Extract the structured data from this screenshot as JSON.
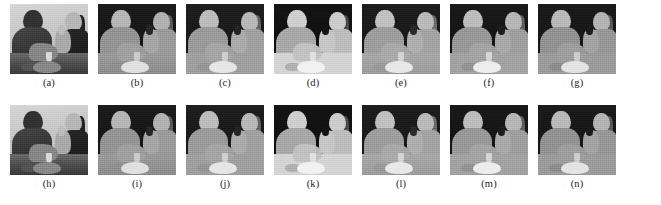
{
  "figure": {
    "background_color": "#ffffff",
    "rows": 2,
    "columns": 7,
    "tile_width_px": 78,
    "tile_height_px": 70
  },
  "panels": [
    {
      "label": "(a)",
      "kind": "photo",
      "style_key": "photo",
      "name": "panel-a",
      "description": "Grayscale photograph of two people seated at a table facing each other"
    },
    {
      "label": "(b)",
      "kind": "depth-map",
      "style_key": "d-b",
      "name": "panel-b",
      "description": "Estimated depth map, dark background with mid-gray figures"
    },
    {
      "label": "(c)",
      "kind": "depth-map",
      "style_key": "d-c",
      "name": "panel-c",
      "description": "Estimated depth map, slightly brighter figures than (b)"
    },
    {
      "label": "(d)",
      "kind": "depth-map",
      "style_key": "d-d",
      "name": "panel-d",
      "description": "Estimated depth map, high contrast with very bright foreground"
    },
    {
      "label": "(e)",
      "kind": "depth-map",
      "style_key": "d-e",
      "name": "panel-e",
      "description": "Estimated depth map, smooth gradients across the table"
    },
    {
      "label": "(f)",
      "kind": "depth-map",
      "style_key": "d-f",
      "name": "panel-f",
      "description": "Estimated depth map, well-defined raised hand and arm"
    },
    {
      "label": "(g)",
      "kind": "depth-map",
      "style_key": "d-g",
      "name": "panel-g",
      "description": "Estimated depth map, flatter separation near the table"
    },
    {
      "label": "(h)",
      "kind": "photo",
      "style_key": "photo",
      "name": "panel-h",
      "description": "Grayscale photograph, second frame of the same scene"
    },
    {
      "label": "(i)",
      "kind": "depth-map",
      "style_key": "d-b",
      "name": "panel-i",
      "description": "Estimated depth map for second frame, dark background"
    },
    {
      "label": "(j)",
      "kind": "depth-map",
      "style_key": "d-c",
      "name": "panel-j",
      "description": "Estimated depth map for second frame, brighter figures"
    },
    {
      "label": "(k)",
      "kind": "depth-map",
      "style_key": "d-d",
      "name": "panel-k",
      "description": "Estimated depth map for second frame, high contrast"
    },
    {
      "label": "(l)",
      "kind": "depth-map",
      "style_key": "d-e",
      "name": "panel-l",
      "description": "Estimated depth map for second frame, smooth gradients"
    },
    {
      "label": "(m)",
      "kind": "depth-map",
      "style_key": "d-f",
      "name": "panel-m",
      "description": "Estimated depth map for second frame, defined raised hand"
    },
    {
      "label": "(n)",
      "kind": "depth-map",
      "style_key": "d-g",
      "name": "panel-n",
      "description": "Estimated depth map for second frame, flatter table separation"
    }
  ]
}
